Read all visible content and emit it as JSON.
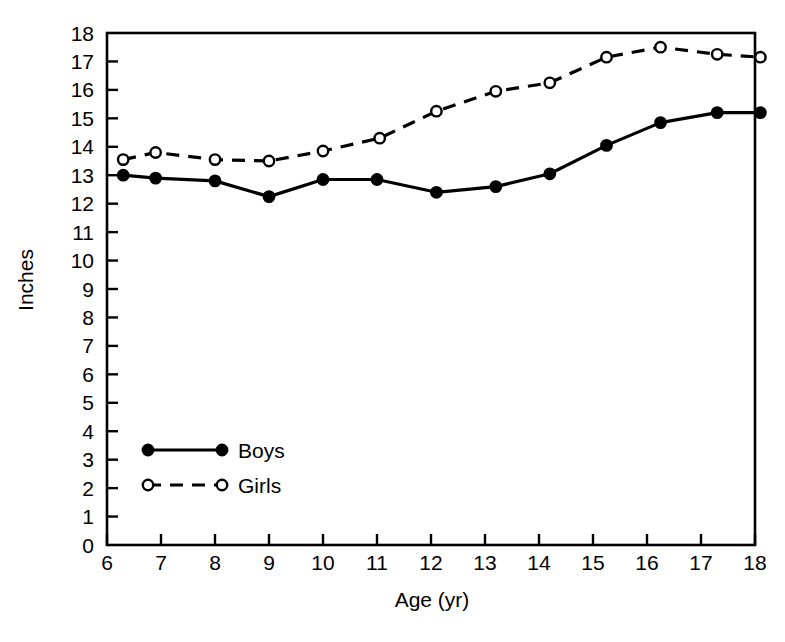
{
  "chart_data": {
    "type": "line",
    "title": "",
    "xlabel": "Age (yr)",
    "ylabel": "Inches",
    "xlim": [
      6,
      18
    ],
    "ylim": [
      0,
      18
    ],
    "grid": false,
    "legend_position": "inside-lower-left",
    "xticks": [
      6,
      7,
      8,
      9,
      10,
      11,
      12,
      13,
      14,
      15,
      16,
      17,
      18
    ],
    "xtick_labels": [
      "6",
      "7",
      "8",
      "9",
      "10",
      "11",
      "12",
      "13",
      "14",
      "15",
      "16",
      "17",
      "18"
    ],
    "yticks": [
      0,
      1,
      2,
      3,
      4,
      5,
      6,
      7,
      8,
      9,
      10,
      11,
      12,
      13,
      14,
      15,
      16,
      17,
      18
    ],
    "ytick_labels": [
      "0",
      "1",
      "2",
      "3",
      "4",
      "5",
      "6",
      "7",
      "8",
      "9",
      "10",
      "11",
      "12",
      "13",
      "14",
      "15",
      "16",
      "17",
      "18"
    ],
    "series": [
      {
        "name": "Boys",
        "marker": "filled-circle",
        "linestyle": "solid",
        "color": "#000000",
        "x": [
          6.3,
          6.9,
          8.0,
          9.0,
          10.0,
          11.0,
          12.1,
          13.2,
          14.2,
          15.25,
          16.25,
          17.3,
          18.1
        ],
        "values": [
          13.0,
          12.9,
          12.8,
          12.25,
          12.85,
          12.85,
          12.4,
          12.6,
          13.05,
          14.05,
          14.85,
          15.2,
          15.2
        ]
      },
      {
        "name": "Girls",
        "marker": "open-circle",
        "linestyle": "dashed",
        "color": "#000000",
        "x": [
          6.3,
          6.9,
          8.0,
          9.0,
          10.0,
          11.05,
          12.1,
          13.2,
          14.2,
          15.25,
          16.25,
          17.3,
          18.1
        ],
        "values": [
          13.55,
          13.8,
          13.55,
          13.5,
          13.85,
          14.3,
          15.25,
          15.95,
          16.25,
          17.15,
          17.5,
          17.25,
          17.15
        ]
      }
    ]
  },
  "legend": {
    "items": [
      {
        "label": "Boys"
      },
      {
        "label": "Girls"
      }
    ]
  }
}
